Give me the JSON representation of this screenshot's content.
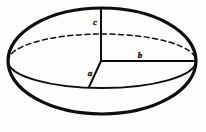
{
  "figure": {
    "kind": "ellipsoid-diagram",
    "background_color": "#fdfdfc",
    "ink_color": "#0d0d0d",
    "canvas": {
      "width": 206,
      "height": 132
    }
  },
  "geometry": {
    "outline_ellipse": {
      "cx": 102,
      "cy": 61,
      "rx": 94,
      "ry": 53
    },
    "equator_ellipse": {
      "cx": 102,
      "cy": 61,
      "rx": 94,
      "ry": 27
    },
    "center_point": {
      "x": 101,
      "y": 61
    },
    "top_point": {
      "x": 101,
      "y": 8
    },
    "right_point": {
      "x": 196,
      "y": 61
    },
    "front_point": {
      "x": 89,
      "y": 87
    }
  },
  "labels": {
    "semi_axis_c": "c",
    "semi_axis_b": "b",
    "semi_axis_a": "a"
  },
  "label_positions": {
    "semi_axis_c": {
      "x": 95,
      "y": 25
    },
    "semi_axis_b": {
      "x": 140,
      "y": 58
    },
    "semi_axis_a": {
      "x": 90,
      "y": 76
    }
  },
  "strokes": {
    "outline_width": 3.2,
    "equator_front_width": 2.0,
    "equator_back_width": 1.5,
    "axis_width": 2.0,
    "back_dash_pattern": "5,3.5"
  }
}
